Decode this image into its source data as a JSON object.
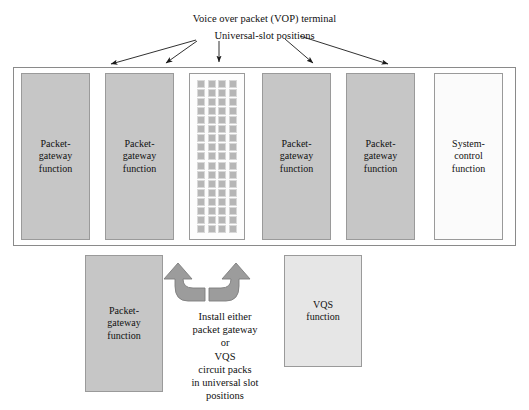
{
  "figure": {
    "title": "Voice over packet (VOP) terminal",
    "subtitle": "Universal-slot positions"
  },
  "chassis": {
    "slots": [
      {
        "id": "slot-0",
        "label": "Packet-\ngateway\nfunction",
        "fill": "#c6c6c6"
      },
      {
        "id": "slot-1",
        "label": "Packet-\ngateway\nfunction",
        "fill": "#c6c6c6"
      },
      {
        "id": "slot-grid",
        "label": "",
        "fill": "#fdfdfd",
        "kind": "universal-slot-grid"
      },
      {
        "id": "slot-2",
        "label": "Packet-\ngateway\nfunction",
        "fill": "#c6c6c6"
      },
      {
        "id": "slot-3",
        "label": "Packet-\ngateway\nfunction",
        "fill": "#c6c6c6"
      },
      {
        "id": "slot-4",
        "label": "System-\ncontrol\nfunction",
        "fill": "#fbfbfb"
      }
    ],
    "grid": {
      "columns": 4,
      "rows": 17,
      "cell_fill": "#b6b6b6"
    }
  },
  "lower": {
    "packet_gateway": {
      "label": "Packet-\ngateway\nfunction",
      "fill": "#c6c6c6"
    },
    "vqs": {
      "label": "VQS\nfunction",
      "fill": "#e6e6e6"
    }
  },
  "instruction": {
    "lines": [
      "Install either",
      "packet gateway",
      "or",
      "VQS",
      "circuit packs",
      "in universal slot",
      "positions"
    ]
  },
  "colors": {
    "box_grey": "#c6c6c6",
    "box_light": "#fbfbfb",
    "vqs_grey": "#e6e6e6",
    "outline": "#9a9a9a",
    "arrow_fill": "#9c9c9c",
    "text": "#111111"
  }
}
